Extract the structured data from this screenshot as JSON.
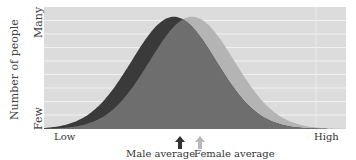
{
  "chart_data": {
    "type": "area",
    "title": "",
    "xlabel": "",
    "ylabel": "Number of people",
    "x_ticks": [
      "Low",
      "High"
    ],
    "y_ticks": [
      "Few",
      "Many"
    ],
    "grid": true,
    "legend": "none",
    "series": [
      {
        "name": "Male",
        "color": "#3a3a3a",
        "mean": 0.43,
        "sd": 0.14,
        "peak": 0.92
      },
      {
        "name": "Female",
        "color": "#b4b4b4",
        "mean": 0.49,
        "sd": 0.14,
        "peak": 0.92
      }
    ],
    "overlap_color": "#6e6e6e",
    "annotations": [
      {
        "label": "Male average",
        "x": 0.45,
        "arrow_color": "#333333"
      },
      {
        "label": "Female average",
        "x": 0.505,
        "arrow_color": "#b8b8b8"
      }
    ]
  },
  "labels": {
    "ylabel": "Number of people",
    "y_many": "Many",
    "y_few": "Few",
    "x_low": "Low",
    "x_high": "High",
    "male_avg": "Male average",
    "female_avg": "Female average"
  }
}
